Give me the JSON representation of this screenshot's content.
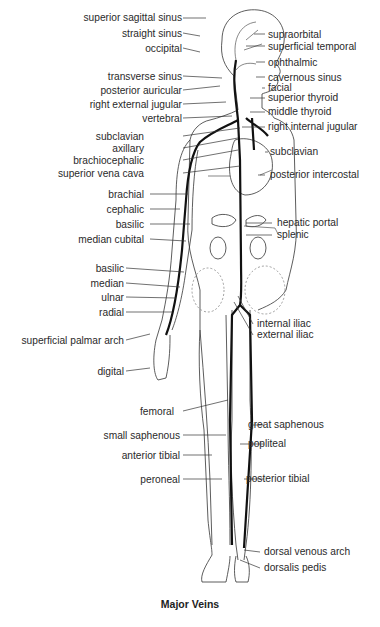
{
  "diagram": {
    "title": "Major Veins",
    "left_labels": [
      {
        "text": "superior sagittal sinus",
        "y": 14
      },
      {
        "text": "straight sinus",
        "y": 30
      },
      {
        "text": "occipital",
        "y": 45
      },
      {
        "text": "transverse sinus",
        "y": 73
      },
      {
        "text": "posterior auricular",
        "y": 87
      },
      {
        "text": "right external jugular",
        "y": 101
      },
      {
        "text": "vertebral",
        "y": 115
      },
      {
        "text": "subclavian",
        "y": 133
      },
      {
        "text": "axillary",
        "y": 145
      },
      {
        "text": "brachiocephalic",
        "y": 157
      },
      {
        "text": "superior vena cava",
        "y": 170
      },
      {
        "text": "brachial",
        "y": 191
      },
      {
        "text": "cephalic",
        "y": 206
      },
      {
        "text": "basilic",
        "y": 221
      },
      {
        "text": "median cubital",
        "y": 236
      },
      {
        "text": "basilic",
        "y": 265
      },
      {
        "text": "median",
        "y": 280
      },
      {
        "text": "ulnar",
        "y": 294
      },
      {
        "text": "radial",
        "y": 309
      },
      {
        "text": "superficial palmar arch",
        "y": 337
      },
      {
        "text": "digital",
        "y": 368
      },
      {
        "text": "femoral",
        "y": 408
      },
      {
        "text": "small saphenous",
        "y": 432
      },
      {
        "text": "anterior tibial",
        "y": 452
      },
      {
        "text": "peroneal",
        "y": 476
      }
    ],
    "right_labels": [
      {
        "text": "supraorbital",
        "y": 31
      },
      {
        "text": "superficial temporal",
        "y": 43
      },
      {
        "text": "ophthalmic",
        "y": 59
      },
      {
        "text": "cavernous sinus",
        "y": 74
      },
      {
        "text": "facial",
        "y": 85
      },
      {
        "text": "superior thyroid",
        "y": 95
      },
      {
        "text": "middle thyroid",
        "y": 109
      },
      {
        "text": "right internal jugular",
        "y": 124
      },
      {
        "text": "subclavian",
        "y": 149
      },
      {
        "text": "posterior intercostal",
        "y": 172
      },
      {
        "text": "hepatic portal",
        "y": 220
      },
      {
        "text": "splenic",
        "y": 232
      },
      {
        "text": "internal iliac",
        "y": 321
      },
      {
        "text": "external iliac",
        "y": 332
      },
      {
        "text": "great saphenous",
        "y": 422
      },
      {
        "text": "popliteal",
        "y": 441
      },
      {
        "text": "posterior tibial",
        "y": 476
      },
      {
        "text": "dorsal venous arch",
        "y": 549
      },
      {
        "text": "dorsalis pedis",
        "y": 565
      }
    ]
  }
}
